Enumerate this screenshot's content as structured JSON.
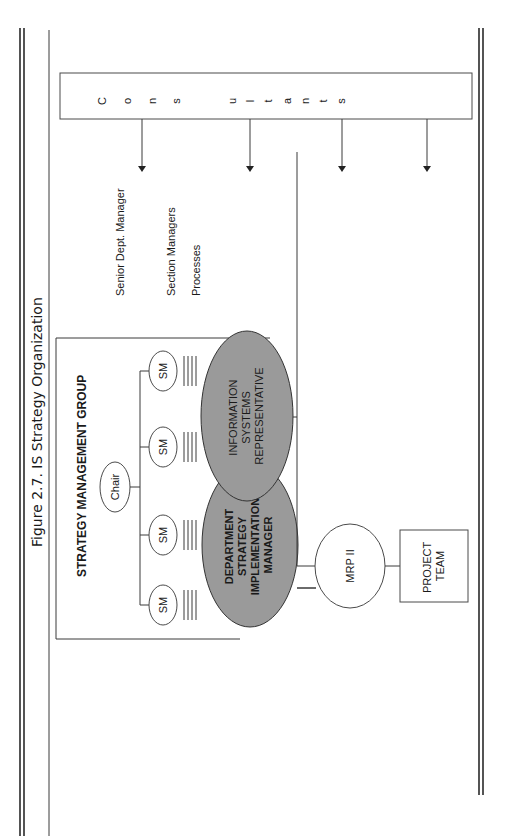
{
  "figure": {
    "caption": "Figure 2.7. IS Strategy Organization"
  },
  "consultants": {
    "label_letters": [
      "C",
      "o",
      "n",
      "s",
      "u",
      "l",
      "t",
      "a",
      "n",
      "t",
      "s"
    ],
    "label": "Consultants"
  },
  "strategy_group": {
    "title": "STRATEGY MANAGEMENT GROUP",
    "chair": "Chair",
    "section_managers": [
      "SM",
      "SM",
      "SM",
      "SM"
    ]
  },
  "legend": {
    "senior": "Senior Dept. Manager",
    "section": "Section Managers",
    "processes": "Processes"
  },
  "key_roles": {
    "dsim": [
      "DEPARTMENT",
      "STRATEGY",
      "IMPLEMENTATION",
      "MANAGER"
    ],
    "isr": [
      "INFORMATION",
      "SYSTEMS",
      "REPRESENTATIVE"
    ]
  },
  "projects": [
    {
      "name_lines": [
        "MRP II"
      ],
      "team_lines": [
        "PROJECT",
        "TEAM"
      ]
    },
    {
      "name_lines": [
        "Document",
        "Management"
      ],
      "team_lines": [
        "PROJECT",
        "TEAM"
      ]
    },
    {
      "name_lines": [
        "Maint.",
        "Management"
      ],
      "team_lines": [
        "PROJECT",
        "TEAM"
      ]
    },
    {
      "name_lines": [
        "EBRS"
      ],
      "team_lines": [
        "PROJECT",
        "TEAM"
      ]
    },
    {
      "name_lines": [
        "DCS"
      ],
      "team_lines": [
        "PROJECT",
        "TEAM"
      ]
    }
  ],
  "colors": {
    "highlight_fill": "#9a9a9a",
    "line": "#3a3a3a"
  }
}
